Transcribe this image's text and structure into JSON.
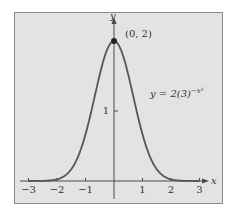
{
  "chart_data": {
    "type": "line",
    "title": "",
    "xlabel": "x",
    "ylabel": "y",
    "function": "y = 2(3)^(-x^2)",
    "equation_label": {
      "prefix": "y = 2(3)",
      "exponent": "−x²"
    },
    "xlim": [
      -3.2,
      3.2
    ],
    "ylim": [
      0,
      2.1
    ],
    "x_ticks": [
      -3,
      -2,
      -1,
      1,
      2,
      3
    ],
    "x_tick_labels": [
      "−3",
      "−2",
      "−1",
      "1",
      "2",
      "3"
    ],
    "y_ticks": [
      1
    ],
    "y_tick_labels": [
      "1"
    ],
    "grid": false,
    "legend": null,
    "annotations": [
      {
        "text": "(0, 2)",
        "x": 0,
        "y": 2,
        "marker": "filled-dot"
      }
    ],
    "series": [
      {
        "name": "y = 2(3)^(-x^2)",
        "x": [
          -3,
          -2.5,
          -2,
          -1.75,
          -1.5,
          -1.25,
          -1,
          -0.75,
          -0.5,
          -0.25,
          0,
          0.25,
          0.5,
          0.75,
          1,
          1.25,
          1.5,
          1.75,
          2,
          2.5,
          3
        ],
        "y": [
          0.0004,
          0.0214,
          0.0247,
          0.0696,
          0.1686,
          0.3581,
          0.6667,
          1.0775,
          1.5197,
          1.874,
          2.0,
          1.874,
          1.5197,
          1.0775,
          0.6667,
          0.3581,
          0.1686,
          0.0696,
          0.0247,
          0.0214,
          0.0004
        ]
      }
    ],
    "colors": {
      "background": "#ffffff",
      "plot_area": "#e3e3e3",
      "curve": "#555555",
      "axes": "#4a4a4a"
    }
  }
}
